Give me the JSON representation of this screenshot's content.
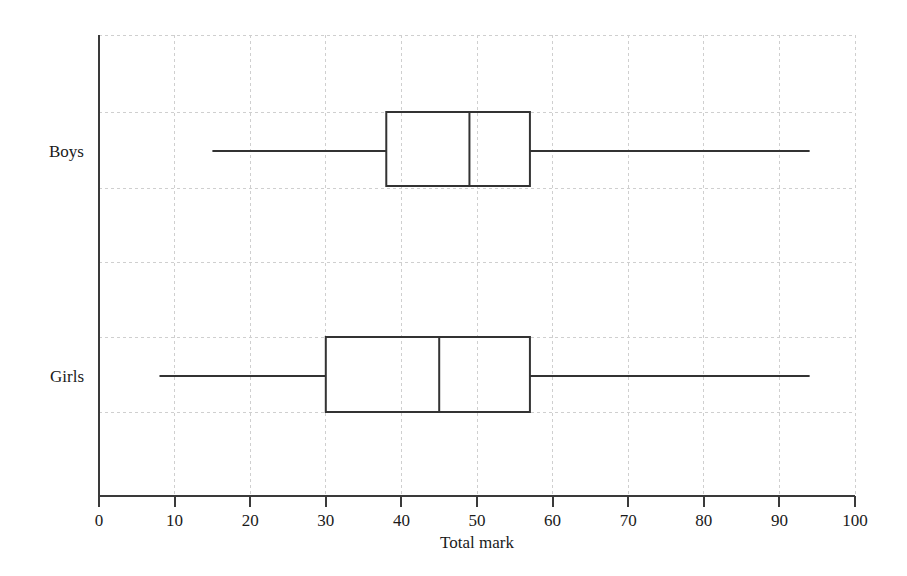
{
  "chart_data": {
    "type": "box",
    "title": "",
    "subtitle": "",
    "xlabel": "Total mark",
    "ylabel": "",
    "xlim": [
      0,
      100
    ],
    "grid": true,
    "legend": "none",
    "orientation": "horizontal",
    "categories": [
      "Boys",
      "Girls"
    ],
    "xticks": [
      0,
      10,
      20,
      30,
      40,
      50,
      60,
      70,
      80,
      90,
      100
    ],
    "xticklabels": [
      "0",
      "10",
      "20",
      "30",
      "40",
      "50",
      "60",
      "70",
      "80",
      "90",
      "100"
    ],
    "boxes": [
      {
        "name": "Boys",
        "min": 15,
        "q1": 38,
        "median": 49,
        "q3": 57,
        "max": 94
      },
      {
        "name": "Girls",
        "min": 8,
        "q1": 30,
        "median": 45,
        "q3": 57,
        "max": 94
      }
    ],
    "colors": {
      "box_stroke": "#333333",
      "whisker": "#333333",
      "median": "#333333",
      "grid": "#cfcfcf",
      "axis": "#3a3a3a",
      "background": "#ffffff"
    }
  }
}
